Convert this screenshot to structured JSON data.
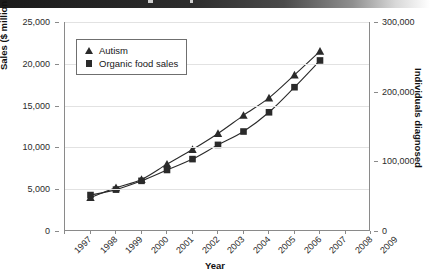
{
  "banner": {
    "present": true,
    "color_dark": "#1b1b1b",
    "color_light": "#ffffff"
  },
  "axes": {
    "left": {
      "title": "Sales ($ millions)",
      "ticks": [
        "0",
        "5,000",
        "10,000",
        "15,000",
        "20,000",
        "25,000"
      ],
      "min": 0,
      "max": 25000
    },
    "right": {
      "title": "Individuals diagnosed",
      "ticks": [
        "0",
        "100,000",
        "200,000",
        "300,000"
      ],
      "min": 0,
      "max": 300000
    },
    "x": {
      "title": "Year",
      "ticks": [
        "1997",
        "1998",
        "1999",
        "2000",
        "2001",
        "2002",
        "2003",
        "2004",
        "2005",
        "2006",
        "2007",
        "2008",
        "2009"
      ]
    }
  },
  "legend": {
    "position": "top-left-inside",
    "items": [
      {
        "label": "Autism",
        "marker": "triangle-marker",
        "color": "#2a2a2a"
      },
      {
        "label": "Organic food sales",
        "marker": "square-marker",
        "color": "#2a2a2a"
      }
    ]
  },
  "chart_data": {
    "type": "line",
    "title": "",
    "subtitle": "",
    "xlabel": "Year",
    "ylabel": "Sales ($ millions)",
    "y2label": "Individuals diagnosed",
    "x": [
      1997,
      1998,
      1999,
      2000,
      2001,
      2002,
      2003,
      2004,
      2005,
      2006,
      2007,
      2008,
      2009
    ],
    "xlim": [
      1997,
      2009
    ],
    "ylim": [
      0,
      25000
    ],
    "y2lim": [
      0,
      300000
    ],
    "grid": true,
    "legend_position": "upper left",
    "series": [
      {
        "name": "Autism",
        "axis": "right",
        "marker": "triangle",
        "color": "#2a2a2a",
        "x": [
          1998,
          1999,
          2000,
          2001,
          2002,
          2003,
          2004,
          2005,
          2006,
          2007
        ],
        "values": [
          48000,
          62000,
          74000,
          96000,
          117000,
          140000,
          166000,
          191000,
          224000,
          258000
        ]
      },
      {
        "name": "Organic food sales",
        "axis": "left",
        "marker": "square",
        "color": "#2a2a2a",
        "x": [
          1998,
          1999,
          2000,
          2001,
          2002,
          2003,
          2004,
          2005,
          2006,
          2007
        ],
        "values": [
          4300,
          4950,
          6000,
          7300,
          8600,
          10300,
          11900,
          14200,
          17200,
          20400
        ]
      }
    ]
  }
}
